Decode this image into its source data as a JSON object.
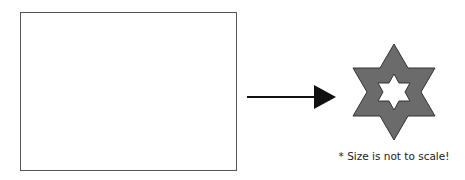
{
  "diagram": {
    "source_box": {
      "label": "",
      "stroke": "#555555",
      "fill": "#ffffff"
    },
    "arrow": {
      "color": "#111111",
      "direction": "right"
    },
    "target_shape": {
      "shape": "hexagram-with-hollow-center",
      "fill": "#6b6b6b",
      "stroke": "#333333",
      "hole_fill": "#ffffff"
    },
    "note": "* Size is not to scale!"
  }
}
